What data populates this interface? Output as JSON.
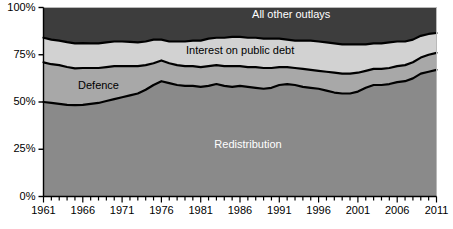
{
  "chart_data": {
    "type": "area",
    "title": "",
    "subtitle": "",
    "xlabel": "",
    "ylabel": "",
    "stacked": true,
    "stack_normalized": true,
    "grid": false,
    "legend_position": "inline-labels",
    "xlim": [
      1961,
      2011
    ],
    "ylim": [
      0,
      100
    ],
    "y_tick_labels": [
      "0%",
      "25%",
      "50%",
      "75%",
      "100%"
    ],
    "y_ticks": [
      0,
      25,
      50,
      75,
      100
    ],
    "x_tick_labels": [
      "1961",
      "1966",
      "1971",
      "1976",
      "1981",
      "1986",
      "1991",
      "1996",
      "2001",
      "2006",
      "2011"
    ],
    "x_ticks": [
      1961,
      1966,
      1971,
      1976,
      1981,
      1986,
      1991,
      1996,
      2001,
      2006,
      2011
    ],
    "x_minor_tick_step": 1,
    "x": [
      1961,
      1962,
      1963,
      1964,
      1965,
      1966,
      1967,
      1968,
      1969,
      1970,
      1971,
      1972,
      1973,
      1974,
      1975,
      1976,
      1977,
      1978,
      1979,
      1980,
      1981,
      1982,
      1983,
      1984,
      1985,
      1986,
      1987,
      1988,
      1989,
      1990,
      1991,
      1992,
      1993,
      1994,
      1995,
      1996,
      1997,
      1998,
      1999,
      2000,
      2001,
      2002,
      2003,
      2004,
      2005,
      2006,
      2007,
      2008,
      2009,
      2010,
      2011
    ],
    "series": [
      {
        "name": "Redistribution",
        "color": "#8a8a8a",
        "label_color": "#ffffff",
        "values": [
          50.0,
          49.5,
          49.0,
          48.5,
          48.3,
          48.5,
          49.0,
          49.5,
          50.5,
          51.5,
          52.5,
          53.5,
          54.5,
          56.5,
          59.0,
          61.0,
          60.0,
          59.0,
          58.5,
          58.5,
          58.0,
          58.5,
          59.5,
          58.5,
          58.0,
          58.5,
          58.0,
          57.5,
          57.0,
          57.5,
          59.0,
          59.5,
          59.0,
          58.0,
          57.5,
          57.0,
          56.0,
          55.0,
          54.5,
          54.5,
          55.5,
          57.5,
          59.0,
          59.0,
          59.5,
          60.5,
          61.0,
          62.5,
          65.0,
          66.0,
          67.0
        ]
      },
      {
        "name": "Defence",
        "color": "#a8a8a8",
        "label_color": "#000000",
        "values": [
          21.0,
          20.5,
          20.5,
          20.0,
          19.5,
          19.5,
          19.0,
          18.5,
          18.0,
          17.5,
          16.5,
          15.5,
          14.5,
          13.0,
          11.5,
          11.0,
          10.5,
          10.5,
          10.5,
          10.5,
          10.5,
          10.5,
          10.0,
          10.5,
          11.0,
          10.5,
          10.5,
          11.0,
          11.0,
          10.5,
          9.5,
          9.0,
          9.0,
          9.5,
          9.5,
          9.5,
          10.0,
          10.5,
          10.5,
          10.5,
          10.0,
          9.0,
          8.5,
          8.5,
          8.5,
          8.5,
          8.5,
          8.5,
          8.5,
          9.0,
          9.0
        ]
      },
      {
        "name": "Interest on public debt",
        "color": "#d2d2d2",
        "label_color": "#000000",
        "values": [
          13.0,
          13.0,
          13.0,
          13.2,
          13.2,
          13.2,
          13.0,
          13.0,
          13.0,
          13.0,
          13.0,
          12.8,
          12.5,
          12.5,
          12.5,
          11.0,
          11.5,
          12.5,
          13.0,
          13.5,
          14.0,
          14.5,
          14.5,
          15.0,
          15.5,
          15.5,
          15.5,
          15.5,
          15.5,
          15.5,
          15.0,
          14.5,
          14.5,
          15.0,
          15.5,
          15.5,
          15.5,
          15.5,
          15.5,
          15.5,
          15.0,
          14.0,
          13.5,
          13.5,
          13.5,
          13.0,
          12.5,
          12.0,
          11.5,
          11.0,
          10.5
        ]
      },
      {
        "name": "All other outlays",
        "color": "#3d3d3d",
        "label_color": "#ffffff",
        "values": [
          16.0,
          17.0,
          17.5,
          18.3,
          19.0,
          18.8,
          19.0,
          19.0,
          18.5,
          18.0,
          18.0,
          18.2,
          18.5,
          18.0,
          17.0,
          17.0,
          18.0,
          18.0,
          18.0,
          17.5,
          17.5,
          16.5,
          16.0,
          16.0,
          15.5,
          15.5,
          16.0,
          16.0,
          16.5,
          16.5,
          16.5,
          17.0,
          17.5,
          17.5,
          17.5,
          18.0,
          18.5,
          19.0,
          19.5,
          19.5,
          19.5,
          19.5,
          19.0,
          19.0,
          18.5,
          18.0,
          18.0,
          17.0,
          15.0,
          14.0,
          13.5
        ]
      }
    ],
    "annotations": [
      {
        "text": "All other outlays",
        "series": "All other outlays"
      },
      {
        "text": "Interest on public debt",
        "series": "Interest on public debt"
      },
      {
        "text": "Defence",
        "series": "Defence"
      },
      {
        "text": "Redistribution",
        "series": "Redistribution"
      }
    ],
    "colors": {
      "axis": "#000000",
      "boundary_line": "#000000",
      "background": "#ffffff"
    }
  }
}
